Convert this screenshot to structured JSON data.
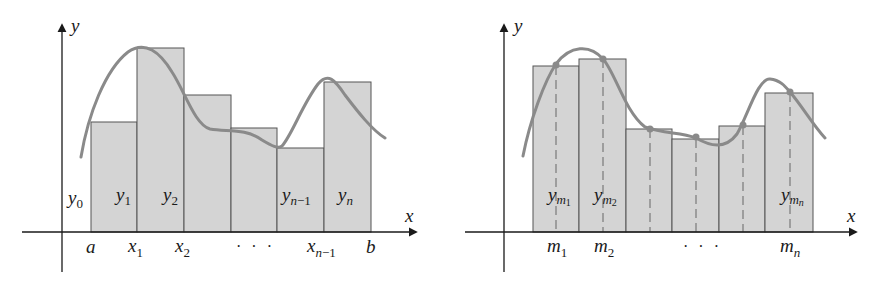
{
  "left_figure": {
    "title": "Trapezoid / endpoint approximation",
    "axis_labels": {
      "x": "x",
      "y": "y"
    },
    "ordinate_labels": [
      {
        "base": "y",
        "sub": "0"
      },
      {
        "base": "y",
        "sub": "1"
      },
      {
        "base": "y",
        "sub": "2"
      },
      {
        "base": "y",
        "sub": "n−1",
        "sub_italic_part": "n",
        "sub_rest": "−1"
      },
      {
        "base": "y",
        "sub": "n"
      }
    ],
    "abscissa_labels": [
      "a",
      "x₁",
      "x₂",
      "· · ·",
      "xₙ₋₁",
      "b"
    ],
    "tick_a": "a",
    "tick_x1": {
      "base": "x",
      "sub": "1"
    },
    "tick_x2": {
      "base": "x",
      "sub": "2"
    },
    "ellipsis": "· · ·",
    "tick_xn1": {
      "base": "x",
      "sub_i": "n",
      "sub_rest": "−1"
    },
    "tick_b": "b",
    "bar_count": 6
  },
  "right_figure": {
    "title": "Midpoint approximation",
    "axis_labels": {
      "x": "x",
      "y": "y"
    },
    "ordinate_labels": [
      {
        "base": "y",
        "sub": "m",
        "subsub": "1"
      },
      {
        "base": "y",
        "sub": "m",
        "subsub": "2"
      },
      {
        "base": "y",
        "sub": "m",
        "subsub": "n"
      }
    ],
    "tick_m1": {
      "base": "m",
      "sub": "1"
    },
    "tick_m2": {
      "base": "m",
      "sub": "2"
    },
    "ellipsis": "· · ·",
    "tick_mn": {
      "base": "m",
      "sub": "n"
    },
    "bar_count": 6
  },
  "colors": {
    "bar_fill": "#d4d4d4",
    "bar_stroke": "#555555",
    "curve": "#8a8a8a",
    "axis": "#1a1a1a",
    "midpoint_dot": "#8a8a8a"
  }
}
